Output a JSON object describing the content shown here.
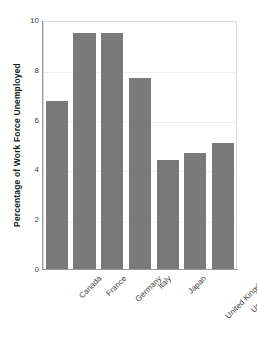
{
  "chart_data": {
    "type": "bar",
    "title": "",
    "subtitle": "",
    "xlabel": "",
    "ylabel": "Percentage of Work Force Unemployed",
    "categories": [
      "Canada",
      "France",
      "Germany",
      "Italy",
      "Japan",
      "United Kingdom",
      "United States"
    ],
    "values": [
      6.8,
      9.5,
      9.5,
      7.7,
      4.4,
      4.7,
      5.1
    ],
    "series": [
      {
        "name": "Percentage of Work Force Unemployed",
        "values": [
          6.8,
          9.5,
          9.5,
          7.7,
          4.4,
          4.7,
          5.1
        ]
      }
    ],
    "ylim": [
      0,
      10
    ],
    "yticks": [
      0,
      2,
      4,
      6,
      8,
      10
    ],
    "ytick_labels": [
      "0",
      "2",
      "4",
      "6",
      "8",
      "10"
    ],
    "xtick_rotation": -45,
    "grid": "horizontal-faint",
    "legend": "none",
    "bar_color": "#7a7a7a",
    "plot_background": "#ffffff",
    "axis_color": "#9a9a9a",
    "gridline_color": "#f0f0f0",
    "text_color": "#3d3d3d"
  },
  "axes": {
    "y_title": "Percentage of Work Force Unemployed"
  }
}
